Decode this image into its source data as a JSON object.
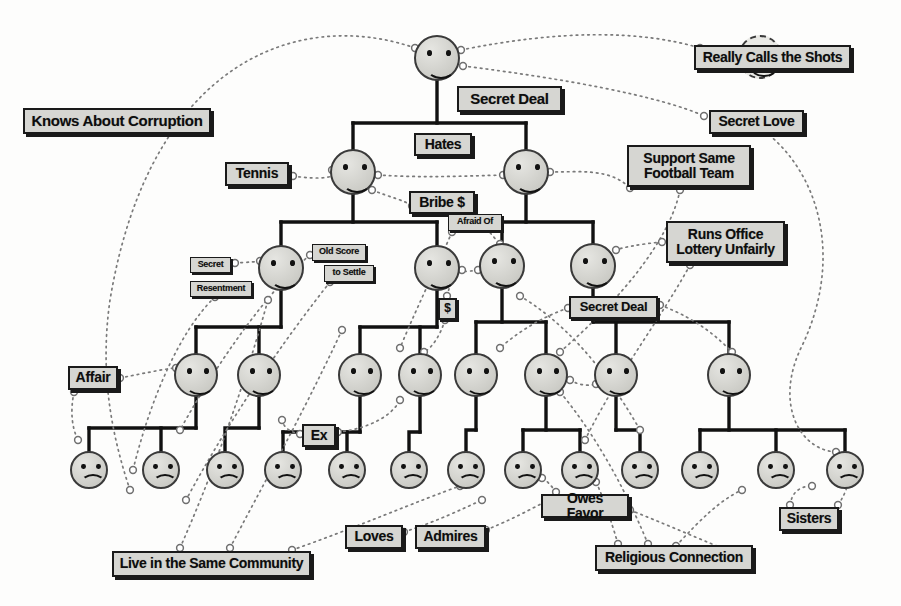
{
  "diagram": {
    "style": {
      "ink": "#1a1a1a",
      "label_fill": "#d6d6d2",
      "face_fill": "#d2d2cd",
      "face_stroke": "#3a3a3a",
      "tree_line": "#111111",
      "relation_line": "#6a6a6a"
    },
    "labels": [
      {
        "id": "knows-about-corruption",
        "text": "Knows About Corruption",
        "x": 23,
        "y": 108,
        "w": 188,
        "h": 26,
        "size": 15
      },
      {
        "id": "secret-deal-top",
        "text": "Secret Deal",
        "x": 457,
        "y": 86,
        "w": 105,
        "h": 26,
        "size": 15
      },
      {
        "id": "really-calls-the-shots",
        "text": "Really Calls the Shots",
        "x": 694,
        "y": 45,
        "w": 157,
        "h": 25,
        "size": 14
      },
      {
        "id": "secret-love",
        "text": "Secret Love",
        "x": 709,
        "y": 110,
        "w": 95,
        "h": 24,
        "size": 14
      },
      {
        "id": "tennis",
        "text": "Tennis",
        "x": 225,
        "y": 162,
        "w": 64,
        "h": 24,
        "size": 14
      },
      {
        "id": "hates",
        "text": "Hates",
        "x": 414,
        "y": 133,
        "w": 58,
        "h": 23,
        "size": 14
      },
      {
        "id": "support-same-football-team",
        "text": "Support Same\nFootball Team",
        "x": 627,
        "y": 145,
        "w": 124,
        "h": 42,
        "size": 14
      },
      {
        "id": "bribe",
        "text": "Bribe $",
        "x": 409,
        "y": 191,
        "w": 66,
        "h": 23,
        "size": 14
      },
      {
        "id": "afraid-of",
        "text": "Afraid Of",
        "x": 448,
        "y": 214,
        "w": 54,
        "h": 17,
        "size": 9
      },
      {
        "id": "runs-office-lottery",
        "text": "Runs Office\nLottery Unfairly",
        "x": 666,
        "y": 221,
        "w": 119,
        "h": 42,
        "size": 14
      },
      {
        "id": "old-score",
        "text": "Old Score",
        "x": 312,
        "y": 244,
        "w": 54,
        "h": 17,
        "size": 9
      },
      {
        "id": "to-settle",
        "text": "to Settle",
        "x": 324,
        "y": 265,
        "w": 50,
        "h": 17,
        "size": 9
      },
      {
        "id": "secret",
        "text": "Secret",
        "x": 190,
        "y": 257,
        "w": 41,
        "h": 16,
        "size": 9
      },
      {
        "id": "resentment",
        "text": "Resentment",
        "x": 190,
        "y": 281,
        "w": 62,
        "h": 16,
        "size": 9
      },
      {
        "id": "dollar",
        "text": "$",
        "x": 438,
        "y": 298,
        "w": 19,
        "h": 22,
        "size": 12
      },
      {
        "id": "secret-deal-mid",
        "text": "Secret Deal",
        "x": 569,
        "y": 296,
        "w": 89,
        "h": 23,
        "size": 13
      },
      {
        "id": "affair",
        "text": "Affair",
        "x": 68,
        "y": 366,
        "w": 50,
        "h": 24,
        "size": 14
      },
      {
        "id": "ex",
        "text": "Ex",
        "x": 302,
        "y": 424,
        "w": 34,
        "h": 23,
        "size": 14
      },
      {
        "id": "owes-favor",
        "text": "Owes Favor",
        "x": 541,
        "y": 494,
        "w": 88,
        "h": 24,
        "size": 14
      },
      {
        "id": "sisters",
        "text": "Sisters",
        "x": 779,
        "y": 507,
        "w": 60,
        "h": 24,
        "size": 14
      },
      {
        "id": "loves",
        "text": "Loves",
        "x": 345,
        "y": 525,
        "w": 58,
        "h": 24,
        "size": 14
      },
      {
        "id": "admires",
        "text": "Admires",
        "x": 415,
        "y": 525,
        "w": 71,
        "h": 24,
        "size": 14
      },
      {
        "id": "live-in-the-same-community",
        "text": "Live in the Same Community",
        "x": 112,
        "y": 551,
        "w": 199,
        "h": 26,
        "size": 14
      },
      {
        "id": "religious-connection",
        "text": "Religious Connection",
        "x": 595,
        "y": 545,
        "w": 158,
        "h": 26,
        "size": 14
      }
    ],
    "faces": [
      {
        "id": "f-root",
        "mood": "happy",
        "cx": 437,
        "cy": 58,
        "r": 23,
        "dashed": false
      },
      {
        "id": "f-boss",
        "mood": "happy",
        "cx": 760,
        "cy": 57,
        "r": 22,
        "dashed": true
      },
      {
        "id": "f-2a",
        "mood": "happy",
        "cx": 353,
        "cy": 172,
        "r": 23,
        "dashed": false
      },
      {
        "id": "f-2b",
        "mood": "happy",
        "cx": 526,
        "cy": 172,
        "r": 23,
        "dashed": false
      },
      {
        "id": "f-3a",
        "mood": "happy",
        "cx": 281,
        "cy": 268,
        "r": 23,
        "dashed": false
      },
      {
        "id": "f-3b",
        "mood": "happy",
        "cx": 437,
        "cy": 268,
        "r": 23,
        "dashed": false
      },
      {
        "id": "f-3c",
        "mood": "happy",
        "cx": 502,
        "cy": 266,
        "r": 23,
        "dashed": false
      },
      {
        "id": "f-3d",
        "mood": "happy",
        "cx": 593,
        "cy": 266,
        "r": 23,
        "dashed": false
      },
      {
        "id": "f-4a",
        "mood": "happy",
        "cx": 196,
        "cy": 375,
        "r": 22,
        "dashed": false
      },
      {
        "id": "f-4b",
        "mood": "happy",
        "cx": 259,
        "cy": 375,
        "r": 22,
        "dashed": false
      },
      {
        "id": "f-4c",
        "mood": "happy",
        "cx": 360,
        "cy": 375,
        "r": 22,
        "dashed": false
      },
      {
        "id": "f-4d",
        "mood": "happy",
        "cx": 420,
        "cy": 375,
        "r": 22,
        "dashed": false
      },
      {
        "id": "f-4e",
        "mood": "happy",
        "cx": 476,
        "cy": 375,
        "r": 22,
        "dashed": false
      },
      {
        "id": "f-4f",
        "mood": "happy",
        "cx": 546,
        "cy": 375,
        "r": 22,
        "dashed": false
      },
      {
        "id": "f-4g",
        "mood": "happy",
        "cx": 616,
        "cy": 375,
        "r": 22,
        "dashed": false
      },
      {
        "id": "f-4h",
        "mood": "happy",
        "cx": 729,
        "cy": 375,
        "r": 22,
        "dashed": false
      },
      {
        "id": "f-5a",
        "mood": "sad",
        "cx": 89,
        "cy": 470,
        "r": 19,
        "dashed": false
      },
      {
        "id": "f-5b",
        "mood": "sad",
        "cx": 161,
        "cy": 470,
        "r": 19,
        "dashed": false
      },
      {
        "id": "f-5c",
        "mood": "sad",
        "cx": 225,
        "cy": 470,
        "r": 19,
        "dashed": false
      },
      {
        "id": "f-5d",
        "mood": "sad",
        "cx": 283,
        "cy": 470,
        "r": 19,
        "dashed": false
      },
      {
        "id": "f-5e",
        "mood": "sad",
        "cx": 347,
        "cy": 470,
        "r": 19,
        "dashed": false
      },
      {
        "id": "f-5f",
        "mood": "sad",
        "cx": 409,
        "cy": 470,
        "r": 19,
        "dashed": false
      },
      {
        "id": "f-5g",
        "mood": "sad",
        "cx": 466,
        "cy": 470,
        "r": 19,
        "dashed": false
      },
      {
        "id": "f-5h",
        "mood": "sad",
        "cx": 523,
        "cy": 470,
        "r": 19,
        "dashed": false
      },
      {
        "id": "f-5i",
        "mood": "sad",
        "cx": 580,
        "cy": 470,
        "r": 19,
        "dashed": false
      },
      {
        "id": "f-5j",
        "mood": "sad",
        "cx": 640,
        "cy": 470,
        "r": 19,
        "dashed": false
      },
      {
        "id": "f-5k",
        "mood": "sad",
        "cx": 700,
        "cy": 470,
        "r": 19,
        "dashed": false
      },
      {
        "id": "f-5l",
        "mood": "sad",
        "cx": 776,
        "cy": 470,
        "r": 19,
        "dashed": false
      },
      {
        "id": "f-5m",
        "mood": "sad",
        "cx": 845,
        "cy": 470,
        "r": 19,
        "dashed": false
      }
    ],
    "tree_edges": [
      {
        "from": "f-root",
        "to": [
          "f-2a",
          "f-2b"
        ],
        "bus_y": 123
      },
      {
        "from": "f-2a",
        "to": [
          "f-3a",
          "f-3b"
        ],
        "bus_y": 222
      },
      {
        "from": "f-2b",
        "to": [
          "f-3c",
          "f-3d"
        ],
        "bus_y": 222
      },
      {
        "from": "f-3a",
        "to": [
          "f-4a",
          "f-4b"
        ],
        "bus_y": 327
      },
      {
        "from": "f-3b",
        "to": [
          "f-4c",
          "f-4d"
        ],
        "bus_y": 327
      },
      {
        "from": "f-3c",
        "to": [
          "f-4e",
          "f-4f"
        ],
        "bus_y": 322
      },
      {
        "from": "f-3d",
        "to": [
          "f-4g",
          "f-4h"
        ],
        "bus_y": 322
      },
      {
        "from": "f-4a",
        "to": [
          "f-5a",
          "f-5b"
        ],
        "bus_y": 428
      },
      {
        "from": "f-4b",
        "to": [
          "f-5c"
        ],
        "bus_y": 428
      },
      {
        "from": "f-4c",
        "to": [
          "f-5d",
          "f-5e"
        ],
        "bus_y": 432
      },
      {
        "from": "f-4d",
        "to": [
          "f-5f"
        ],
        "bus_y": 432
      },
      {
        "from": "f-4e",
        "to": [
          "f-5g"
        ],
        "bus_y": 430
      },
      {
        "from": "f-4f",
        "to": [
          "f-5h",
          "f-5i"
        ],
        "bus_y": 430
      },
      {
        "from": "f-4g",
        "to": [
          "f-5j"
        ],
        "bus_y": 430
      },
      {
        "from": "f-4h",
        "to": [
          "f-5k",
          "f-5l",
          "f-5m"
        ],
        "bus_y": 430
      }
    ],
    "relations": [
      {
        "label": "knows-about-corruption",
        "path": "M 415 48 C 300 8 150 60 110 300 C 100 370 110 430 130 490"
      },
      {
        "label": "secret-deal-top",
        "path": "M 461 50 C 560 30 640 30 700 48"
      },
      {
        "label": "really-calls-the-shots",
        "path": "M 463 66 C 560 78 660 96 704 116"
      },
      {
        "label": "secret-love",
        "path": "M 760 128 C 820 170 845 260 800 350 C 775 405 800 450 836 452"
      },
      {
        "label": "tennis",
        "path": "M 293 176 C 320 180 340 178 332 170"
      },
      {
        "label": "hates",
        "path": "M 378 175 C 420 178 470 176 503 175"
      },
      {
        "label": "bribe-from-2a",
        "path": "M 372 190 C 392 198 404 200 412 206"
      },
      {
        "label": "bribe-to-3c",
        "path": "M 472 210 C 492 236 500 244 500 244"
      },
      {
        "label": "support-football",
        "path": "M 550 172 C 580 172 610 168 630 188"
      },
      {
        "label": "football-to-4f",
        "path": "M 680 190 C 670 240 620 300 560 352"
      },
      {
        "label": "runs-lottery-in",
        "path": "M 662 242 C 640 244 620 248 616 250"
      },
      {
        "label": "runs-lottery-out",
        "path": "M 690 265 C 660 320 620 370 585 440"
      },
      {
        "label": "secret-resentment",
        "path": "M 235 263 C 250 262 256 262 260 261"
      },
      {
        "label": "resentment-down",
        "path": "M 215 297 C 180 330 150 400 133 470"
      },
      {
        "label": "old-score-a",
        "path": "M 310 255 C 280 280 230 340 180 430"
      },
      {
        "label": "old-score-b",
        "path": "M 330 282 C 300 320 240 400 186 500"
      },
      {
        "label": "afraid-of-path",
        "path": "M 452 232 C 440 260 420 300 400 348"
      },
      {
        "label": "dollar-a",
        "path": "M 447 296 C 450 285 452 278 455 272"
      },
      {
        "label": "dollar-b",
        "path": "M 445 320 C 440 336 432 348 424 352"
      },
      {
        "label": "secret-deal-mid-a",
        "path": "M 568 308 C 545 316 520 330 500 348"
      },
      {
        "label": "secret-deal-mid-b",
        "path": "M 660 305 C 700 320 720 340 732 352"
      },
      {
        "label": "affair-path",
        "path": "M 120 378 C 150 372 170 368 176 368"
      },
      {
        "label": "affair-down",
        "path": "M 74 392 C 70 412 72 428 78 440"
      },
      {
        "label": "ex-left",
        "path": "M 300 434 C 290 432 284 428 282 420"
      },
      {
        "label": "ex-right",
        "path": "M 338 432 C 360 430 390 420 400 400"
      },
      {
        "label": "live-same-comm-a",
        "path": "M 180 548 C 210 480 240 400 268 300"
      },
      {
        "label": "live-same-comm-b",
        "path": "M 230 548 C 260 490 300 420 342 330"
      },
      {
        "label": "live-same-comm-c",
        "path": "M 292 550 C 350 530 420 500 460 486"
      },
      {
        "label": "loves-path",
        "path": "M 404 532 C 440 520 460 510 482 500"
      },
      {
        "label": "admires-path",
        "path": "M 486 530 C 520 516 540 504 556 496"
      },
      {
        "label": "owes-favor-in",
        "path": "M 556 492 C 550 484 546 480 542 478"
      },
      {
        "label": "owes-favor-out",
        "path": "M 630 510 C 680 530 720 548 742 556"
      },
      {
        "label": "religious-a",
        "path": "M 618 544 C 608 510 600 490 596 482"
      },
      {
        "label": "religious-b",
        "path": "M 648 544 C 630 500 600 440 560 392"
      },
      {
        "label": "religious-c",
        "path": "M 676 546 C 700 520 720 500 742 490"
      },
      {
        "label": "sisters-path",
        "path": "M 790 505 C 792 492 800 486 812 486"
      },
      {
        "label": "sisters-right",
        "path": "M 838 505 C 848 490 850 480 848 462"
      },
      {
        "label": "fourg-fourf-a",
        "path": "M 570 380 C 580 386 590 386 596 384"
      },
      {
        "label": "threec-threeb-a",
        "path": "M 478 270 C 466 272 456 272 462 270"
      },
      {
        "label": "cross-mid",
        "path": "M 520 296 C 560 320 600 360 640 430"
      }
    ]
  }
}
